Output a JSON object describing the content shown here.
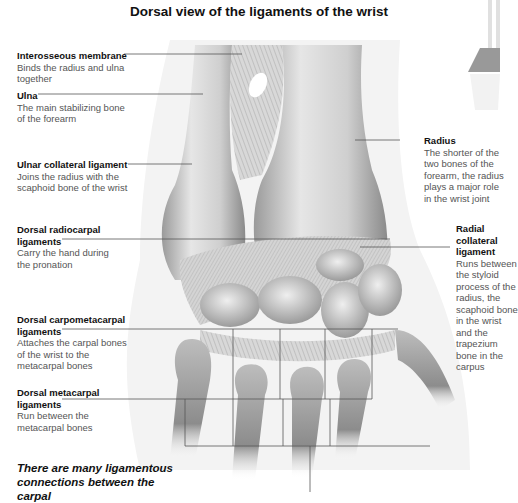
{
  "title": "Dorsal view of the ligaments of the wrist",
  "labels": [
    {
      "heading": "Interosseous membrane",
      "description": "Binds the radius and ulna together"
    },
    {
      "heading": "Ulna",
      "description": "The main stabilizing bone of the forearm"
    },
    {
      "heading": "Ulnar collateral ligament",
      "description": "Joins the radius with the scaphoid bone of the wrist"
    },
    {
      "heading": "Dorsal radiocarpal ligaments",
      "description": "Carry the hand during the pronation"
    },
    {
      "heading": "Dorsal carpometacarpal ligaments",
      "description": "Attaches the carpal bones of the wrist to the metacarpal bones"
    },
    {
      "heading": "Dorsal metacarpal ligaments",
      "description": "Run between the metacarpal bones"
    },
    {
      "heading": "Radius",
      "description": "The shorter of the two bones of the forearm, the radius plays a major role in the wrist joint"
    },
    {
      "heading": "Radial collateral ligament",
      "description": "Runs between the styloid process of the radius, the scaphoid bone in the wrist and the trapezium bone in the carpus"
    }
  ],
  "footer": "There are many ligamentous connections between the carpal",
  "thumbnail": {
    "name": "forearm-locator-thumbnail",
    "highlight": "wrist"
  }
}
